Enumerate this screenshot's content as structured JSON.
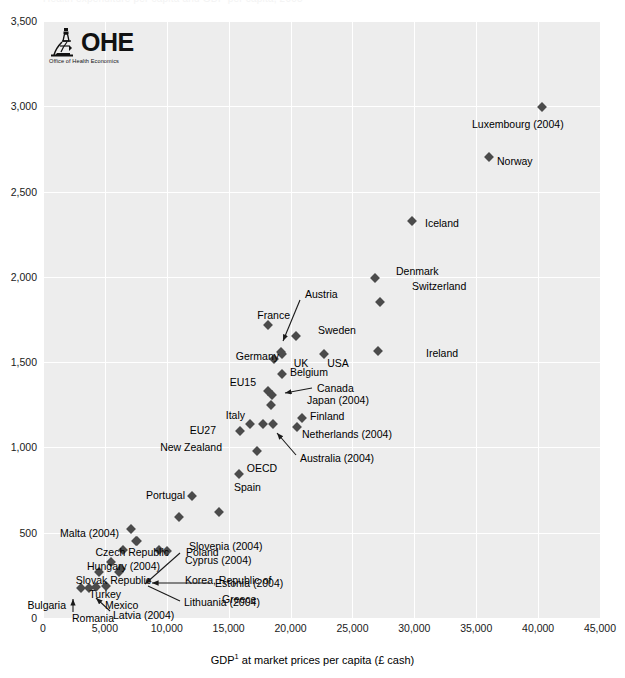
{
  "chart_data": {
    "type": "scatter",
    "title": "Health expenditure per capita and GDP per capita, 2005",
    "xlabel": "GDP¹ at market prices per capita (£ cash)",
    "ylabel": "",
    "xlim": [
      0,
      45000
    ],
    "ylim": [
      0,
      3500
    ],
    "xticks": [
      "0",
      "5,000",
      "10,000",
      "15,000",
      "20,000",
      "25,000",
      "30,000",
      "35,000",
      "40,000",
      "45,000"
    ],
    "xtick_values": [
      0,
      5000,
      10000,
      15000,
      20000,
      25000,
      30000,
      35000,
      40000,
      45000
    ],
    "yticks": [
      "0",
      "500",
      "1,000",
      "1,500",
      "2,000",
      "2,500",
      "3,000",
      "3,500"
    ],
    "ytick_values": [
      0,
      500,
      1000,
      1500,
      2000,
      2500,
      3000,
      3500
    ],
    "grid": true,
    "legend": "none",
    "marker_shape": "diamond",
    "marker_color": "#4b4b4b",
    "plot_background": "#ededed",
    "gridline_color": "#ffffff",
    "points": [
      {
        "label": "Luxembourg (2004)",
        "x": 40300,
        "y": 2995,
        "lpos": "below"
      },
      {
        "label": "Norway",
        "x": 36000,
        "y": 2700,
        "lpos": "right"
      },
      {
        "label": "Iceland",
        "x": 29800,
        "y": 2330,
        "lpos": "right"
      },
      {
        "label": "Denmark",
        "x": 26800,
        "y": 1995,
        "lpos": "right"
      },
      {
        "label": "Switzerland",
        "x": 27200,
        "y": 1855,
        "lpos": "below-right"
      },
      {
        "label": "Ireland",
        "x": 27100,
        "y": 1565,
        "lpos": "right"
      },
      {
        "label": "France",
        "x": 18200,
        "y": 1720,
        "lpos": "above-left"
      },
      {
        "label": "Sweden",
        "x": 20400,
        "y": 1655,
        "lpos": "right"
      },
      {
        "label": "UK",
        "x": 19300,
        "y": 1545,
        "lpos": "below"
      },
      {
        "label": "Austria",
        "x": 19200,
        "y": 1560,
        "lpos": "arrow"
      },
      {
        "label": "USA",
        "x": 22700,
        "y": 1545,
        "lpos": "below"
      },
      {
        "label": "Germany",
        "x": 18700,
        "y": 1520,
        "lpos": "left"
      },
      {
        "label": "Belgium",
        "x": 19300,
        "y": 1430,
        "lpos": "right"
      },
      {
        "label": "EU15",
        "x": 18200,
        "y": 1330,
        "lpos": "left"
      },
      {
        "label": "Canada",
        "x": 18500,
        "y": 1305,
        "lpos": "arrow"
      },
      {
        "label": "Japan (2004)",
        "x": 18400,
        "y": 1250,
        "lpos": "right"
      },
      {
        "label": "Finland",
        "x": 20900,
        "y": 1175,
        "lpos": "right"
      },
      {
        "label": "Netherlands (2004)",
        "x": 20500,
        "y": 1120,
        "lpos": "right"
      },
      {
        "label": "Italy",
        "x": 17800,
        "y": 1140,
        "lpos": "above-left"
      },
      {
        "label": "Australia (2004)",
        "x": 18600,
        "y": 1140,
        "lpos": "arrow"
      },
      {
        "label": "EU27",
        "x": 16700,
        "y": 1140,
        "lpos": "left"
      },
      {
        "label": "New Zealand",
        "x": 15900,
        "y": 1095,
        "lpos": "left"
      },
      {
        "label": "OECD",
        "x": 17300,
        "y": 980,
        "lpos": "below"
      },
      {
        "label": "Spain",
        "x": 15800,
        "y": 845,
        "lpos": "below-right"
      },
      {
        "label": "Portugal",
        "x": 12000,
        "y": 715,
        "lpos": "above-left"
      },
      {
        "label": "Greece",
        "x": 14200,
        "y": 620,
        "lpos": "right"
      },
      {
        "label": "Slovenia (2004)",
        "x": 11000,
        "y": 590,
        "lpos": "below-right"
      },
      {
        "label": "Malta (2004)",
        "x": 7100,
        "y": 520,
        "lpos": "left"
      },
      {
        "label": "Czech Republic",
        "x": 7500,
        "y": 450,
        "lpos": "left"
      },
      {
        "label": "Poland",
        "x": 7600,
        "y": 450,
        "lpos": "arrow"
      },
      {
        "label": "Hungary (2004)",
        "x": 6500,
        "y": 400,
        "lpos": "left"
      },
      {
        "label": "Cyprus (2004)",
        "x": 9400,
        "y": 400,
        "lpos": "above-right"
      },
      {
        "label": "Korea, Republic of",
        "x": 10000,
        "y": 395,
        "lpos": "right"
      },
      {
        "label": "Slovak Republic",
        "x": 5500,
        "y": 330,
        "lpos": "left"
      },
      {
        "label": "Estonia (2004)",
        "x": 6300,
        "y": 290,
        "lpos": "arrow"
      },
      {
        "label": "Turkey",
        "x": 4500,
        "y": 270,
        "lpos": "left"
      },
      {
        "label": "Lithuania (2004)",
        "x": 6100,
        "y": 270,
        "lpos": "arrow"
      },
      {
        "label": "Mexico",
        "x": 5100,
        "y": 185,
        "lpos": "right"
      },
      {
        "label": "Latvia (2004)",
        "x": 4300,
        "y": 180,
        "lpos": "arrow"
      },
      {
        "label": "Bulgaria",
        "x": 3100,
        "y": 175,
        "lpos": "left"
      },
      {
        "label": "Romania",
        "x": 3700,
        "y": 175,
        "lpos": "arrow"
      }
    ]
  },
  "logo": {
    "name": "OHE",
    "subtitle": "Office of Health Economics",
    "icon": "microscope-icon"
  }
}
